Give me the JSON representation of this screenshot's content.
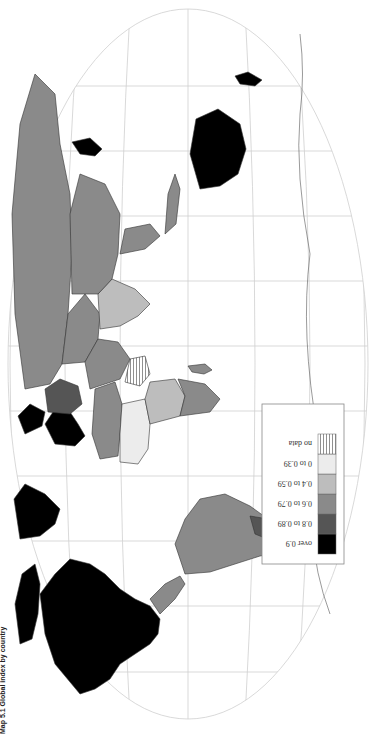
{
  "map": {
    "title": "World map: global index choropleth",
    "caption": "Map 5.1  Global index by country",
    "projection": "elliptical world projection with graticule",
    "orientation": "rotated 90° counter-clockwise on page"
  },
  "legend": {
    "items": [
      {
        "label": "over 0.9",
        "color": "#000000",
        "pattern": "solid"
      },
      {
        "label": "0.8 to 0.89",
        "color": "#555555",
        "pattern": "solid"
      },
      {
        "label": "0.6 to 0.79",
        "color": "#8a8a8a",
        "pattern": "solid"
      },
      {
        "label": "0.4 to 0.59",
        "color": "#bdbdbd",
        "pattern": "solid"
      },
      {
        "label": "0 to 0.39",
        "color": "#ececec",
        "pattern": "solid"
      },
      {
        "label": "no data",
        "color": "#ffffff",
        "pattern": "horizontal-hatch"
      }
    ]
  },
  "regions": {
    "north_america": "over 0.9",
    "greenland": "over 0.9",
    "south_america": "0.6 to 0.79",
    "southern_cone": "0.8 to 0.89",
    "europe_west": "over 0.9",
    "europe_east": "0.8 to 0.89",
    "russia_central_asia": "0.6 to 0.79",
    "china": "0.6 to 0.79",
    "south_asia": "0.4 to 0.59",
    "middle_east": "0.6 to 0.79",
    "north_africa": "0.6 to 0.79",
    "sahel_west_africa": "0 to 0.39",
    "central_africa": "0.4 to 0.59",
    "southern_africa": "0.6 to 0.79",
    "horn_of_africa": "no data",
    "southeast_asia": "0.6 to 0.79",
    "japan_korea": "over 0.9",
    "australia": "over 0.9",
    "new_zealand": "over 0.9",
    "madagascar": "0.6 to 0.79",
    "antarctica": "outline only"
  }
}
